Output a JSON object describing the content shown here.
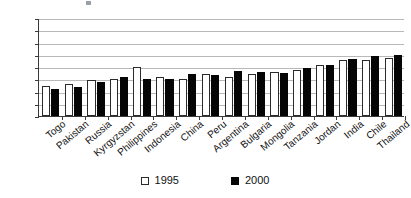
{
  "chart_data": {
    "type": "bar",
    "title": "",
    "subtitle": "",
    "xlabel": "",
    "ylabel": "",
    "ylim": [
      30,
      150
    ],
    "yticks": [
      30,
      45,
      60,
      75,
      90,
      105,
      120,
      135,
      150
    ],
    "grid": true,
    "legend_position": "bottom",
    "categories": [
      "Togo",
      "Pakistan",
      "Russia",
      "Kyrgyzstan",
      "Philippines",
      "Indonesia",
      "China",
      "Peru",
      "Argentina",
      "Bulgaria",
      "Mongolia",
      "Tanzania",
      "Jordan",
      "India",
      "Chile",
      "Thailand"
    ],
    "series": [
      {
        "name": "1995",
        "color": "#ffffff",
        "values": [
          67,
          69,
          74,
          75,
          90,
          78,
          75,
          81,
          78,
          82,
          84,
          86,
          93,
          99,
          99,
          101
        ]
      },
      {
        "name": "2000",
        "color": "#050505",
        "values": [
          63,
          66,
          72,
          78,
          75,
          75,
          82,
          80,
          85,
          84,
          83,
          89,
          92,
          100,
          103,
          105
        ]
      }
    ]
  },
  "legend": {
    "entries": [
      {
        "label": "1995"
      },
      {
        "label": "2000"
      }
    ]
  }
}
